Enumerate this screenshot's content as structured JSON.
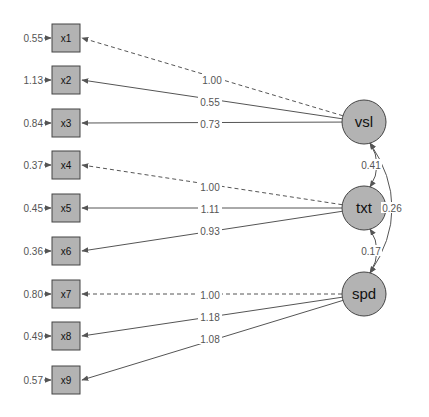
{
  "colors": {
    "node_fill": "#b3b3b3",
    "node_stroke": "#444444",
    "edge": "#555555",
    "label": "#555555"
  },
  "latent": [
    {
      "id": "vsl",
      "label": "vsl",
      "cx": 364,
      "cy": 122
    },
    {
      "id": "txt",
      "label": "txt",
      "cx": 364,
      "cy": 208
    },
    {
      "id": "spd",
      "label": "spd",
      "cx": 364,
      "cy": 294
    }
  ],
  "observed": [
    {
      "id": "x1",
      "label": "x1",
      "cy": 38,
      "residual": "0.55"
    },
    {
      "id": "x2",
      "label": "x2",
      "cy": 80,
      "residual": "1.13"
    },
    {
      "id": "x3",
      "label": "x3",
      "cy": 123,
      "residual": "0.84"
    },
    {
      "id": "x4",
      "label": "x4",
      "cy": 165,
      "residual": "0.37"
    },
    {
      "id": "x5",
      "label": "x5",
      "cy": 208,
      "residual": "0.45"
    },
    {
      "id": "x6",
      "label": "x6",
      "cy": 251,
      "residual": "0.36"
    },
    {
      "id": "x7",
      "label": "x7",
      "cy": 294,
      "residual": "0.80"
    },
    {
      "id": "x8",
      "label": "x8",
      "cy": 336,
      "residual": "0.49"
    },
    {
      "id": "x9",
      "label": "x9",
      "cy": 380,
      "residual": "0.57"
    }
  ],
  "loadings": [
    {
      "from": "vsl",
      "to": "x1",
      "value": "1.00",
      "fixed": true,
      "lx": 212,
      "ly": 80
    },
    {
      "from": "vsl",
      "to": "x2",
      "value": "0.55",
      "fixed": false,
      "lx": 210,
      "ly": 102
    },
    {
      "from": "vsl",
      "to": "x3",
      "value": "0.73",
      "fixed": false,
      "lx": 210,
      "ly": 124
    },
    {
      "from": "txt",
      "to": "x4",
      "value": "1.00",
      "fixed": true,
      "lx": 210,
      "ly": 187
    },
    {
      "from": "txt",
      "to": "x5",
      "value": "1.11",
      "fixed": false,
      "lx": 210,
      "ly": 209
    },
    {
      "from": "txt",
      "to": "x6",
      "value": "0.93",
      "fixed": false,
      "lx": 210,
      "ly": 231
    },
    {
      "from": "spd",
      "to": "x7",
      "value": "1.00",
      "fixed": true,
      "lx": 210,
      "ly": 295
    },
    {
      "from": "spd",
      "to": "x8",
      "value": "1.18",
      "fixed": false,
      "lx": 210,
      "ly": 317
    },
    {
      "from": "spd",
      "to": "x9",
      "value": "1.08",
      "fixed": false,
      "lx": 210,
      "ly": 339
    }
  ],
  "covariances": [
    {
      "a": "vsl",
      "b": "txt",
      "value": "0.41"
    },
    {
      "a": "txt",
      "b": "spd",
      "value": "0.17"
    },
    {
      "a": "vsl",
      "b": "spd",
      "value": "0.26"
    }
  ]
}
